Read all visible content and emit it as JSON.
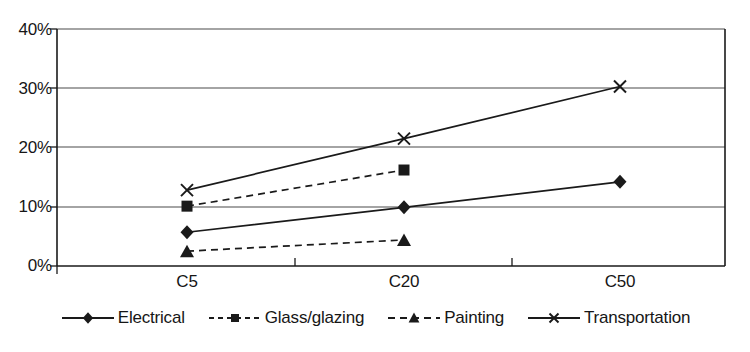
{
  "chart_data": {
    "type": "line",
    "title": "",
    "subtitle": "",
    "xlabel": "",
    "ylabel": "",
    "categories": [
      "C5",
      "C20",
      "C50"
    ],
    "ytick_labels": [
      "0%",
      "10%",
      "20%",
      "30%",
      "40%"
    ],
    "ytick_values": [
      0,
      10,
      20,
      30,
      40
    ],
    "ylim": [
      0,
      40
    ],
    "yunit": "%",
    "grid": "horizontal",
    "legend_position": "bottom",
    "series": [
      {
        "name": "Electrical",
        "marker": "diamond",
        "line": "solid",
        "color": "#1a1a1a",
        "x": [
          "C5",
          "C20",
          "C50"
        ],
        "values": [
          5.7,
          9.9,
          14.2
        ]
      },
      {
        "name": "Glass/glazing",
        "marker": "square",
        "line": "dashed",
        "color": "#1a1a1a",
        "x": [
          "C5",
          "C20"
        ],
        "values": [
          10.1,
          16.2
        ]
      },
      {
        "name": "Painting",
        "marker": "triangle",
        "line": "dashed",
        "color": "#1a1a1a",
        "x": [
          "C5",
          "C20"
        ],
        "values": [
          2.5,
          4.4
        ]
      },
      {
        "name": "Transportation",
        "marker": "cross",
        "line": "solid",
        "color": "#1a1a1a",
        "x": [
          "C5",
          "C20",
          "C50"
        ],
        "values": [
          12.8,
          21.5,
          30.3
        ]
      }
    ]
  },
  "axis": {
    "y_labels": [
      "40%",
      "30%",
      "20%",
      "10%",
      "0%"
    ],
    "x_labels": [
      "C5",
      "C20",
      "C50"
    ]
  },
  "legend": {
    "items": [
      {
        "label": "Electrical"
      },
      {
        "label": "Glass/glazing"
      },
      {
        "label": "Painting"
      },
      {
        "label": "Transportation"
      }
    ]
  }
}
